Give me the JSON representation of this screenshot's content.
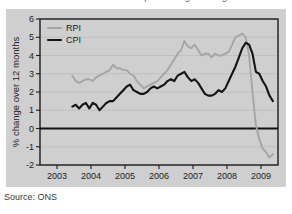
{
  "figure": {
    "title": "Annual inflation: RPI and CPI percentage change over 12 months",
    "source": "Source: ONS",
    "background": "#cfcfcf",
    "page_background": "#ffffff"
  },
  "chart_data": {
    "type": "line",
    "title": "Annual inflation: RPI and CPI percentage change over 12 months",
    "xlabel": "",
    "ylabel": "% change over 12 months",
    "xlim": [
      2002.5,
      2009.5
    ],
    "ylim": [
      -2,
      6
    ],
    "yticks": [
      -2,
      -1,
      0,
      1,
      2,
      3,
      4,
      5,
      6
    ],
    "xticks": [
      2003,
      2004,
      2005,
      2006,
      2007,
      2008,
      2009
    ],
    "xtick_labels": [
      "2003",
      "2004",
      "2005",
      "2006",
      "2007",
      "2008",
      "2009"
    ],
    "ytick_labels": [
      "-2",
      "-1",
      "0",
      "1",
      "2",
      "3",
      "4",
      "5",
      "6"
    ],
    "grid": true,
    "grid_axis": "y",
    "zero_line": 0,
    "legend_position": "top-left",
    "series": [
      {
        "name": "RPI",
        "color": "#a5a5a5",
        "width": 1.9,
        "x": [
          2003.45,
          2003.55,
          2003.65,
          2003.75,
          2003.85,
          2003.95,
          2004.05,
          2004.15,
          2004.25,
          2004.35,
          2004.45,
          2004.55,
          2004.65,
          2004.75,
          2004.85,
          2004.95,
          2005.05,
          2005.15,
          2005.25,
          2005.35,
          2005.45,
          2005.55,
          2005.65,
          2005.75,
          2005.85,
          2005.95,
          2006.05,
          2006.15,
          2006.25,
          2006.35,
          2006.45,
          2006.55,
          2006.65,
          2006.75,
          2006.85,
          2006.95,
          2007.05,
          2007.15,
          2007.25,
          2007.35,
          2007.45,
          2007.55,
          2007.65,
          2007.75,
          2007.85,
          2007.95,
          2008.05,
          2008.15,
          2008.25,
          2008.35,
          2008.45,
          2008.55,
          2008.65,
          2008.75,
          2008.85,
          2008.95,
          2009.05,
          2009.15,
          2009.25,
          2009.35
        ],
        "values": [
          2.9,
          2.6,
          2.5,
          2.6,
          2.7,
          2.7,
          2.6,
          2.8,
          2.9,
          3.0,
          3.1,
          3.2,
          3.5,
          3.3,
          3.3,
          3.2,
          3.2,
          3.0,
          2.9,
          2.6,
          2.4,
          2.2,
          2.3,
          2.4,
          2.5,
          2.6,
          2.8,
          3.0,
          3.2,
          3.5,
          3.8,
          4.1,
          4.3,
          4.8,
          4.5,
          4.4,
          4.6,
          4.3,
          4.0,
          4.1,
          4.1,
          3.9,
          4.1,
          4.0,
          4.0,
          4.1,
          4.2,
          4.6,
          5.0,
          5.1,
          5.2,
          5.0,
          4.0,
          2.0,
          0.2,
          -0.6,
          -1.1,
          -1.3,
          -1.6,
          -1.4
        ]
      },
      {
        "name": "CPI",
        "color": "#141414",
        "width": 2.1,
        "x": [
          2003.45,
          2003.55,
          2003.65,
          2003.75,
          2003.85,
          2003.95,
          2004.05,
          2004.15,
          2004.25,
          2004.35,
          2004.45,
          2004.55,
          2004.65,
          2004.75,
          2004.85,
          2004.95,
          2005.05,
          2005.15,
          2005.25,
          2005.35,
          2005.45,
          2005.55,
          2005.65,
          2005.75,
          2005.85,
          2005.95,
          2006.05,
          2006.15,
          2006.25,
          2006.35,
          2006.45,
          2006.55,
          2006.65,
          2006.75,
          2006.85,
          2006.95,
          2007.05,
          2007.15,
          2007.25,
          2007.35,
          2007.45,
          2007.55,
          2007.65,
          2007.75,
          2007.85,
          2007.95,
          2008.05,
          2008.15,
          2008.25,
          2008.35,
          2008.45,
          2008.55,
          2008.65,
          2008.75,
          2008.85,
          2008.95,
          2009.05,
          2009.15,
          2009.25,
          2009.35
        ],
        "values": [
          1.2,
          1.3,
          1.1,
          1.3,
          1.4,
          1.1,
          1.4,
          1.3,
          1.0,
          1.2,
          1.4,
          1.5,
          1.5,
          1.7,
          1.9,
          2.1,
          2.3,
          2.4,
          2.1,
          2.0,
          1.9,
          1.9,
          2.0,
          2.2,
          2.3,
          2.2,
          2.3,
          2.4,
          2.6,
          2.7,
          2.6,
          2.9,
          3.0,
          3.1,
          2.8,
          2.6,
          2.7,
          2.5,
          2.2,
          1.9,
          1.8,
          1.8,
          1.9,
          2.1,
          2.0,
          2.2,
          2.6,
          3.0,
          3.4,
          3.9,
          4.4,
          4.7,
          4.6,
          4.1,
          3.1,
          3.0,
          2.6,
          2.3,
          1.8,
          1.5
        ]
      }
    ]
  },
  "legend": {
    "items": [
      {
        "label": "RPI",
        "color": "#a5a5a5"
      },
      {
        "label": "CPI",
        "color": "#141414"
      }
    ]
  }
}
